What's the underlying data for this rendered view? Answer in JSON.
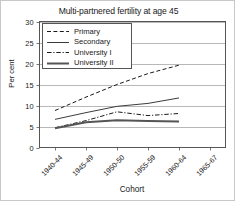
{
  "chart_data": {
    "type": "line",
    "title": "Multi-partnered fertility at age 45",
    "xlabel": "Cohort",
    "ylabel": "Per cent",
    "categories": [
      "1940-44",
      "1945-49",
      "1950-50",
      "1955-59",
      "1960-64",
      "1965-67"
    ],
    "ylim": [
      0,
      30
    ],
    "yticks": [
      0,
      5,
      10,
      15,
      20,
      25,
      30
    ],
    "grid": true,
    "legend_position": "top-left-inside",
    "series": [
      {
        "name": "Primary",
        "style": "dashed",
        "color": "#1a1a1a",
        "width": 1,
        "values": [
          8.8,
          12.0,
          15.0,
          17.6,
          19.6,
          null
        ]
      },
      {
        "name": "Secondary",
        "style": "solid",
        "color": "#3c3c3c",
        "width": 1,
        "values": [
          6.7,
          8.3,
          9.8,
          10.5,
          11.8,
          null
        ]
      },
      {
        "name": "University I",
        "style": "dash-dot",
        "color": "#1a1a1a",
        "width": 1,
        "values": [
          4.7,
          6.4,
          8.5,
          7.6,
          8.1,
          null
        ]
      },
      {
        "name": "University II",
        "style": "solid-thick",
        "color": "#555555",
        "width": 2,
        "values": [
          4.6,
          6.0,
          6.5,
          6.3,
          6.2,
          null
        ]
      }
    ]
  },
  "legend": {
    "items": [
      {
        "label": "Primary"
      },
      {
        "label": "Secondary"
      },
      {
        "label": "University I"
      },
      {
        "label": "University II"
      }
    ]
  }
}
